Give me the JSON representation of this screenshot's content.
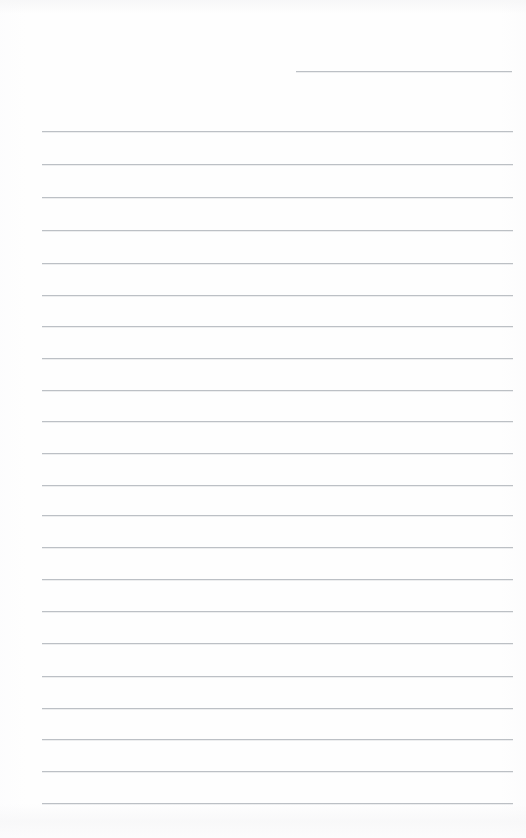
{
  "document": {
    "type": "lined-paper",
    "title": "Blank ruled notepad page",
    "page_width": 526,
    "page_height": 838,
    "paper_color": "#fefefe",
    "rule_color": "#b9bdc2",
    "written_text": "",
    "notes": "Scanned blank ruled writing paper. No text, headings, numbers, or marks are present; only the pre-printed horizontal rules."
  },
  "rules": {
    "count": 23,
    "full_width_count": 22,
    "short_rule_count": 1,
    "left_margin_x": 42,
    "right_edge_x": 512,
    "line_spacing": 31.6,
    "items": [
      {
        "name": "rule-top-short",
        "y": 71,
        "x1": 296,
        "x2": 512,
        "short": true
      },
      {
        "name": "rule-01",
        "y": 131,
        "x1": 42,
        "x2": 513,
        "short": false
      },
      {
        "name": "rule-02",
        "y": 164,
        "x1": 42,
        "x2": 513,
        "short": false
      },
      {
        "name": "rule-03",
        "y": 197,
        "x1": 42,
        "x2": 513,
        "short": false
      },
      {
        "name": "rule-04",
        "y": 230,
        "x1": 42,
        "x2": 513,
        "short": false
      },
      {
        "name": "rule-05",
        "y": 263,
        "x1": 42,
        "x2": 513,
        "short": false
      },
      {
        "name": "rule-06",
        "y": 295,
        "x1": 42,
        "x2": 513,
        "short": false
      },
      {
        "name": "rule-07",
        "y": 326,
        "x1": 42,
        "x2": 513,
        "short": false
      },
      {
        "name": "rule-08",
        "y": 358,
        "x1": 42,
        "x2": 513,
        "short": false
      },
      {
        "name": "rule-09",
        "y": 390,
        "x1": 42,
        "x2": 513,
        "short": false
      },
      {
        "name": "rule-10",
        "y": 421,
        "x1": 42,
        "x2": 513,
        "short": false
      },
      {
        "name": "rule-11",
        "y": 453,
        "x1": 42,
        "x2": 513,
        "short": false
      },
      {
        "name": "rule-12",
        "y": 485,
        "x1": 42,
        "x2": 513,
        "short": false
      },
      {
        "name": "rule-13",
        "y": 515,
        "x1": 42,
        "x2": 513,
        "short": false
      },
      {
        "name": "rule-14",
        "y": 547,
        "x1": 42,
        "x2": 513,
        "short": false
      },
      {
        "name": "rule-15",
        "y": 579,
        "x1": 42,
        "x2": 513,
        "short": false
      },
      {
        "name": "rule-16",
        "y": 611,
        "x1": 42,
        "x2": 513,
        "short": false
      },
      {
        "name": "rule-17",
        "y": 643,
        "x1": 42,
        "x2": 513,
        "short": false
      },
      {
        "name": "rule-18",
        "y": 676,
        "x1": 42,
        "x2": 513,
        "short": false
      },
      {
        "name": "rule-19",
        "y": 708,
        "x1": 42,
        "x2": 513,
        "short": false
      },
      {
        "name": "rule-20",
        "y": 739,
        "x1": 42,
        "x2": 513,
        "short": false
      },
      {
        "name": "rule-21",
        "y": 771,
        "x1": 42,
        "x2": 513,
        "short": false
      },
      {
        "name": "rule-22",
        "y": 803,
        "x1": 42,
        "x2": 513,
        "short": false
      }
    ]
  }
}
